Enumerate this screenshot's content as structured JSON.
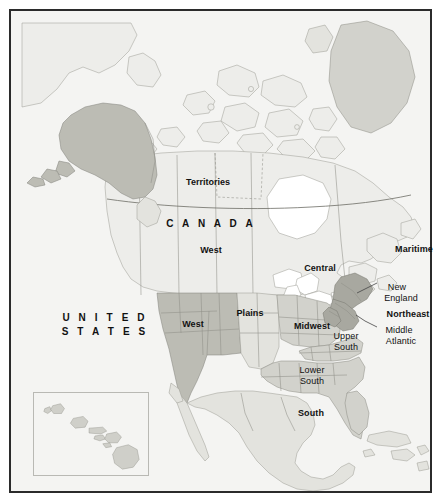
{
  "figure": {
    "kind": "reference-map"
  },
  "frame": {
    "border_color": "#2b2b2b",
    "background_color": "#f4f4f2"
  },
  "palette": {
    "ocean": "#f4f4f2",
    "land_pale": "#ededea",
    "land_light": "#e3e3de",
    "land_medium": "#d2d2cc",
    "land_dark": "#bcbcb4",
    "land_darkest": "#a8a8a0",
    "lakes": "#ffffff",
    "outline": "#8f8f88",
    "outline_strong": "#6d6d66",
    "label_color": "#111111",
    "leader_line": "#444444"
  },
  "countries": [
    {
      "id": "canada",
      "label": "CANADA",
      "style": "country"
    },
    {
      "id": "united-states",
      "label": "UNITED STATES",
      "style": "country",
      "lines": [
        "UNITED",
        "STATES"
      ]
    }
  ],
  "labels": [
    {
      "id": "territories",
      "text": "Territories",
      "weight": "bold",
      "x": 203,
      "y": 174,
      "align": "center"
    },
    {
      "id": "canada",
      "text": "C A N A D A",
      "weight": "bold",
      "x": 206,
      "y": 217,
      "align": "center",
      "letterspaced": true
    },
    {
      "id": "canada-west",
      "text": "West",
      "weight": "bold",
      "x": 206,
      "y": 244,
      "align": "center"
    },
    {
      "id": "canada-central",
      "text": "Central",
      "weight": "bold",
      "x": 315,
      "y": 262,
      "align": "center"
    },
    {
      "id": "maritime",
      "text": "Maritime",
      "weight": "bold",
      "x": 409,
      "y": 243,
      "align": "center"
    },
    {
      "id": "united-states-1",
      "text": "U N I T E D",
      "weight": "bold",
      "x": 100,
      "y": 311,
      "align": "center",
      "letterspaced": true
    },
    {
      "id": "united-states-2",
      "text": "S T A T E S",
      "weight": "bold",
      "x": 100,
      "y": 325,
      "align": "center",
      "letterspaced": true
    },
    {
      "id": "us-west",
      "text": "West",
      "weight": "bold",
      "x": 188,
      "y": 318,
      "align": "center"
    },
    {
      "id": "plains",
      "text": "Plains",
      "weight": "bold",
      "x": 245,
      "y": 307,
      "align": "center"
    },
    {
      "id": "midwest",
      "text": "Midwest",
      "weight": "bold",
      "x": 307,
      "y": 320,
      "align": "center"
    },
    {
      "id": "northeast",
      "text": "Northeast",
      "weight": "bold",
      "x": 403,
      "y": 308,
      "align": "center"
    },
    {
      "id": "new-england-1",
      "text": "New",
      "weight": "normal",
      "x": 392,
      "y": 281,
      "align": "center"
    },
    {
      "id": "new-england-2",
      "text": "England",
      "weight": "normal",
      "x": 396,
      "y": 292,
      "align": "center"
    },
    {
      "id": "middle-atlantic-1",
      "text": "Middle",
      "weight": "normal",
      "x": 394,
      "y": 324,
      "align": "center"
    },
    {
      "id": "middle-atlantic-2",
      "text": "Atlantic",
      "weight": "normal",
      "x": 396,
      "y": 335,
      "align": "center"
    },
    {
      "id": "upper-south-1",
      "text": "Upper",
      "weight": "normal",
      "x": 341,
      "y": 330,
      "align": "center"
    },
    {
      "id": "upper-south-2",
      "text": "South",
      "weight": "normal",
      "x": 341,
      "y": 341,
      "align": "center"
    },
    {
      "id": "lower-south-1",
      "text": "Lower",
      "weight": "normal",
      "x": 307,
      "y": 364,
      "align": "center"
    },
    {
      "id": "lower-south-2",
      "text": "South",
      "weight": "normal",
      "x": 307,
      "y": 375,
      "align": "center"
    },
    {
      "id": "south",
      "text": "South",
      "weight": "bold",
      "x": 306,
      "y": 407,
      "align": "center"
    }
  ],
  "regions": [
    {
      "id": "us-west",
      "name": "West",
      "country": "United States",
      "shade": "land_dark"
    },
    {
      "id": "us-plains",
      "name": "Plains",
      "country": "United States",
      "shade": "land_light"
    },
    {
      "id": "us-midwest",
      "name": "Midwest",
      "country": "United States",
      "shade": "land_medium"
    },
    {
      "id": "us-northeast",
      "name": "Northeast",
      "country": "United States",
      "shade": "land_darkest"
    },
    {
      "id": "us-new-england",
      "name": "New England",
      "country": "United States",
      "shade": "land_darkest"
    },
    {
      "id": "us-mid-atlantic",
      "name": "Middle Atlantic",
      "country": "United States",
      "shade": "land_darkest"
    },
    {
      "id": "us-upper-south",
      "name": "Upper South",
      "country": "United States",
      "shade": "land_medium"
    },
    {
      "id": "us-lower-south",
      "name": "Lower South",
      "country": "United States",
      "shade": "land_medium"
    },
    {
      "id": "us-south",
      "name": "South",
      "country": "United States",
      "shade": "land_medium"
    },
    {
      "id": "ca-territories",
      "name": "Territories",
      "country": "Canada",
      "shade": "land_pale"
    },
    {
      "id": "ca-west",
      "name": "West",
      "country": "Canada",
      "shade": "land_pale"
    },
    {
      "id": "ca-central",
      "name": "Central",
      "country": "Canada",
      "shade": "land_pale"
    },
    {
      "id": "ca-maritime",
      "name": "Maritime",
      "country": "Canada",
      "shade": "land_pale"
    }
  ],
  "leaders": [
    {
      "id": "leader-new-england",
      "from_label": "New England",
      "points": "372,282 356,288 345,292"
    },
    {
      "id": "leader-middle-atlantic",
      "from_label": "Middle Atlantic",
      "points": "372,324 358,316 349,311"
    }
  ],
  "insets": [
    {
      "id": "hawaii-inset",
      "name": "Hawaii",
      "shade": "land_medium",
      "island_count": 8
    }
  ]
}
